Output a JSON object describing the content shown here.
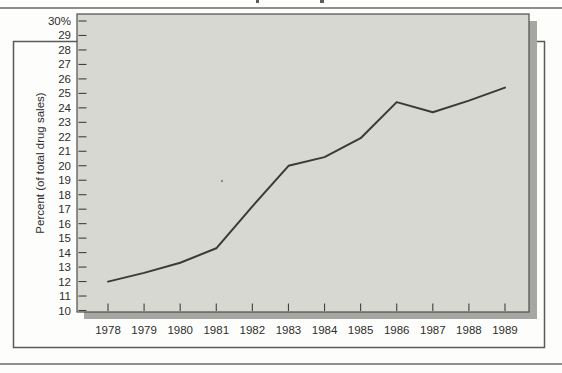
{
  "page": {
    "background": "#fdfdfc",
    "rule_color": "#8f8f8f"
  },
  "chart_data": {
    "type": "line",
    "title": "",
    "xlabel": "",
    "ylabel": "Percent (of total drug sales)",
    "categories": [
      "1978",
      "1979",
      "1980",
      "1981",
      "1982",
      "1983",
      "1984",
      "1985",
      "1986",
      "1987",
      "1988",
      "1989"
    ],
    "values": [
      12.0,
      12.6,
      13.3,
      14.3,
      17.2,
      20.0,
      20.6,
      21.9,
      24.4,
      23.7,
      24.5,
      25.4
    ],
    "ylim": [
      10,
      30
    ],
    "y_tick_step": 1,
    "y_top_tick_label": "30%",
    "grid": false,
    "legend_position": "none",
    "colors": {
      "line": "#3a3a38",
      "plot_background": "#d8d8d3",
      "plot_border": "#4e4e4a",
      "shadow": "#a6a6a2",
      "outer_frame_border": "#5a5a58",
      "tick": "#3f3f3d",
      "text": "#2e2e2c"
    }
  }
}
